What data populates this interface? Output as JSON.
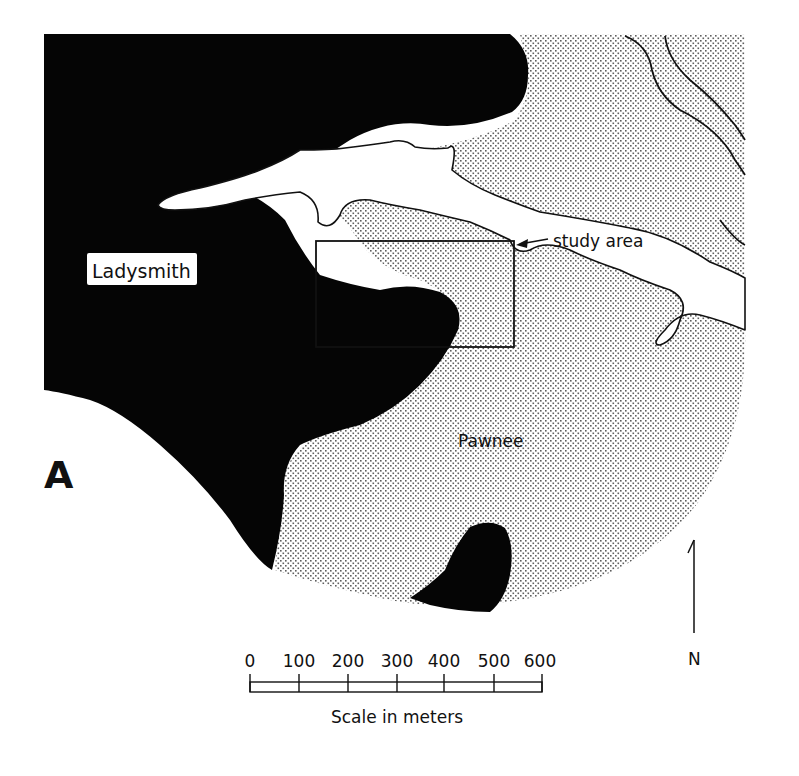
{
  "figure": {
    "panel_label": "A",
    "colors": {
      "ladysmith_fill": "#050505",
      "pawnee_stipple": "#6a6a6a",
      "background": "#ffffff",
      "line": "#111111"
    }
  },
  "map": {
    "regions": [
      {
        "id": "ladysmith",
        "label": "Ladysmith",
        "fill": "solid black"
      },
      {
        "id": "pawnee",
        "label": "Pawnee",
        "fill": "dot stipple"
      },
      {
        "id": "drainage",
        "label": "",
        "fill": "white (unshaded channels)"
      }
    ],
    "annotations": {
      "study_area": "study area"
    }
  },
  "north_arrow": {
    "label": "N"
  },
  "scale_bar": {
    "ticks": [
      "0",
      "100",
      "200",
      "300",
      "400",
      "500",
      "600"
    ],
    "title": "Scale in meters",
    "unit": "meters",
    "max": 600
  }
}
